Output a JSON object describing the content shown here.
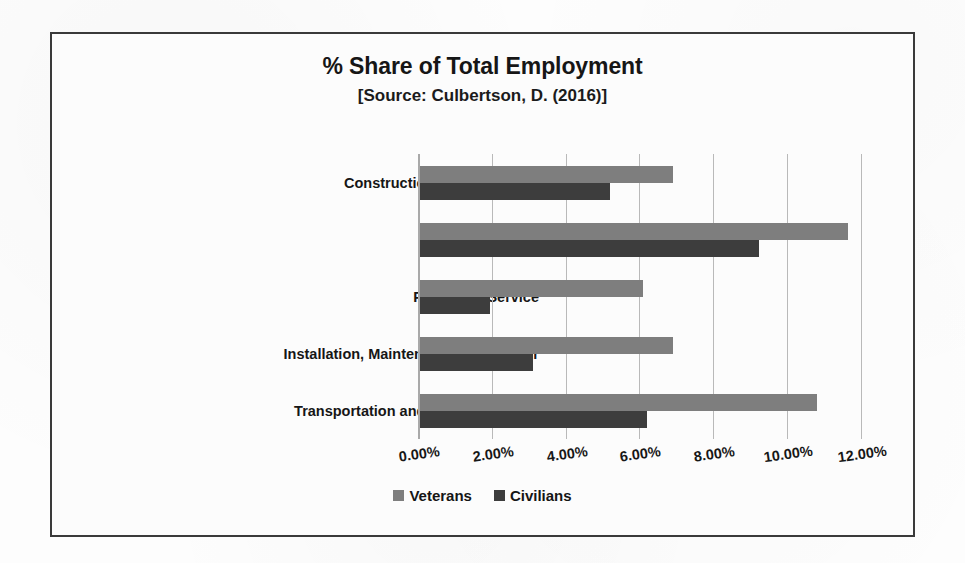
{
  "chart_data": {
    "type": "bar",
    "orientation": "horizontal",
    "title": "% Share of Total Employment",
    "subtitle": "[Source: Culbertson, D. (2016)]",
    "xlabel": "",
    "ylabel": "",
    "xlim": [
      0,
      12
    ],
    "xticks": [
      0,
      2,
      4,
      6,
      8,
      10,
      12
    ],
    "xtick_labels": [
      "0.00%",
      "2.00%",
      "4.00%",
      "6.00%",
      "8.00%",
      "10.00%",
      "12.00%"
    ],
    "grid": true,
    "grid_axis": "x",
    "legend_position": "bottom",
    "categories": [
      "Construction and Extraction",
      "Management",
      "Protective Service",
      "Installation, Maintenance, and Repair",
      "Transportation and Material Moving"
    ],
    "series": [
      {
        "name": "Veterans",
        "color": "#7e7e7e",
        "values": [
          6.85,
          11.6,
          6.05,
          6.85,
          10.75
        ]
      },
      {
        "name": "Civilians",
        "color": "#3d3d3d",
        "values": [
          5.15,
          9.2,
          1.9,
          3.05,
          6.15
        ]
      }
    ]
  },
  "colors": {
    "veterans": "#7e7e7e",
    "civilians": "#3d3d3d",
    "frame_border": "#3a3a3a",
    "gridline": "#b9b9b9",
    "axis_line": "#a9a9a9",
    "text": "#161616",
    "background": "#fcfcfc"
  }
}
